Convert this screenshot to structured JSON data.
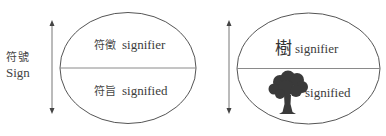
{
  "diagram": {
    "type": "saussurean-sign-model",
    "left_label": {
      "zh": "符號",
      "en": "Sign"
    },
    "left_ellipse": {
      "top": {
        "zh": "符徵",
        "en": "signifier"
      },
      "bottom": {
        "zh": "符旨",
        "en": "signified"
      }
    },
    "right_ellipse": {
      "top": {
        "zh": "樹",
        "en": "signifier"
      },
      "bottom": {
        "image": "tree-icon",
        "en": "signified"
      }
    },
    "colors": {
      "stroke": "#555555",
      "divider": "#8a8a8a",
      "text": "#3c3c3c",
      "tree": "#3a3a3a"
    }
  }
}
